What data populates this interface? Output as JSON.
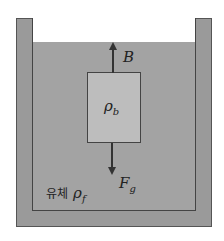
{
  "diagram": {
    "title": "",
    "container": {
      "wall_color": "#9a9a9a",
      "outline_color": "#555555"
    },
    "fluid": {
      "label_prefix": "유체",
      "symbol": "ρ",
      "subscript": "f",
      "color": "#a3a3a3"
    },
    "block": {
      "symbol": "ρ",
      "subscript": "b",
      "color": "#bdbdbd"
    },
    "forces": [
      {
        "name": "buoyant",
        "symbol": "B",
        "subscript": "",
        "direction": "up"
      },
      {
        "name": "gravity",
        "symbol": "F",
        "subscript": "g",
        "direction": "down"
      }
    ]
  }
}
